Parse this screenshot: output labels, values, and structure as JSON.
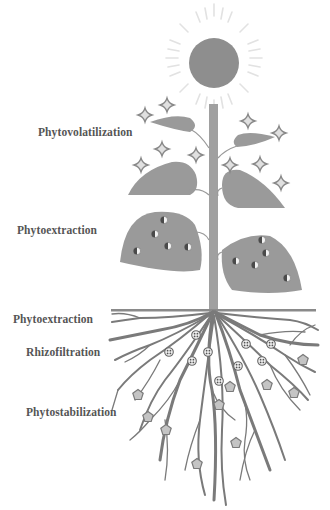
{
  "diagram": {
    "type": "phytoremediation-plant-illustration",
    "labels": [
      {
        "id": "phytovolatilization",
        "text": "Phytovolatilization",
        "x": 38,
        "y": 133
      },
      {
        "id": "phytoextraction-shoot",
        "text": "Phytoextraction",
        "x": 17,
        "y": 231
      },
      {
        "id": "phytoextraction-root",
        "text": "Phytoextraction",
        "x": 13,
        "y": 320
      },
      {
        "id": "rhizofiltration",
        "text": "Rhizofiltration",
        "x": 26,
        "y": 353
      },
      {
        "id": "phytostabilization",
        "text": "Phytostabilization",
        "x": 26,
        "y": 413
      }
    ],
    "colors": {
      "plant_fill": "#9a9a9a",
      "stem": "#a0a0a0",
      "root": "#7a7a7a",
      "sun": "#8e8e8e",
      "sun_rays": "#e2e2e2",
      "soil_line": "#8a8a8a",
      "label_text": "#555555",
      "star_fill": "#e0e0e0",
      "star_stroke": "#888888",
      "pentagon_fill": "#c4c4c4"
    },
    "legend_symbols": {
      "sparkle": "volatilized contaminant",
      "half_dot": "accumulated contaminant in leaves",
      "circled_dots": "filtered contaminant",
      "pentagon": "stabilized contaminant"
    }
  }
}
